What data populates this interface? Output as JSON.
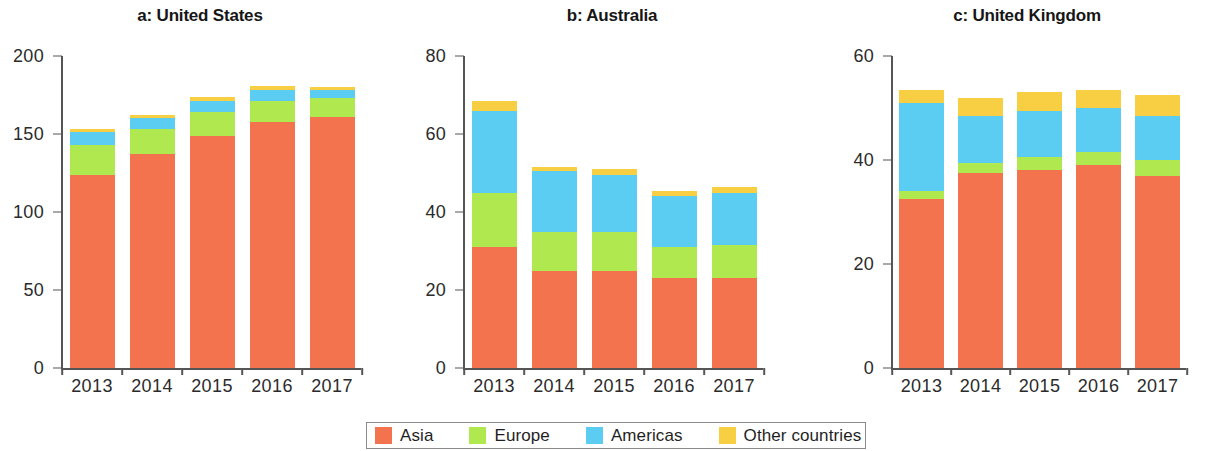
{
  "colors": {
    "asia": "#F4734F",
    "europe": "#B0E94F",
    "americas": "#5CCDF2",
    "other": "#F8CE43",
    "axis": "#555555",
    "text": "#1a1a1a",
    "background": "#ffffff"
  },
  "legend": {
    "items": [
      {
        "label": "Asia",
        "color": "#F4734F"
      },
      {
        "label": "Europe",
        "color": "#B0E94F"
      },
      {
        "label": "Americas",
        "color": "#5CCDF2"
      },
      {
        "label": "Other countries",
        "color": "#F8CE43"
      }
    ]
  },
  "chart_data": [
    {
      "type": "bar",
      "stacked": true,
      "panel": "a",
      "title": "a: United States",
      "xlabel": "",
      "ylabel": "",
      "categories": [
        "2013",
        "2014",
        "2015",
        "2016",
        "2017"
      ],
      "ylim": [
        0,
        200
      ],
      "yticks": [
        0,
        50,
        100,
        150,
        200
      ],
      "grid": false,
      "legend_position": "bottom",
      "series": [
        {
          "name": "Asia",
          "color": "#F4734F",
          "values": [
            124,
            137,
            149,
            158,
            161
          ]
        },
        {
          "name": "Europe",
          "color": "#B0E94F",
          "values": [
            19,
            16,
            15,
            13,
            12
          ]
        },
        {
          "name": "Americas",
          "color": "#5CCDF2",
          "values": [
            8,
            7,
            7,
            7,
            5
          ]
        },
        {
          "name": "Other countries",
          "color": "#F8CE43",
          "values": [
            2,
            2,
            3,
            3,
            2
          ]
        }
      ],
      "totals": [
        153,
        162,
        174,
        181,
        180
      ]
    },
    {
      "type": "bar",
      "stacked": true,
      "panel": "b",
      "title": "b: Australia",
      "xlabel": "",
      "ylabel": "",
      "categories": [
        "2013",
        "2014",
        "2015",
        "2016",
        "2017"
      ],
      "ylim": [
        0,
        80
      ],
      "yticks": [
        0,
        20,
        40,
        60,
        80
      ],
      "grid": false,
      "legend_position": "bottom",
      "series": [
        {
          "name": "Asia",
          "color": "#F4734F",
          "values": [
            31,
            25,
            25,
            23,
            23
          ]
        },
        {
          "name": "Europe",
          "color": "#B0E94F",
          "values": [
            14,
            10,
            10,
            8,
            8.5
          ]
        },
        {
          "name": "Americas",
          "color": "#5CCDF2",
          "values": [
            21,
            15.5,
            14.5,
            13,
            13.5
          ]
        },
        {
          "name": "Other countries",
          "color": "#F8CE43",
          "values": [
            2.5,
            1,
            1.5,
            1.5,
            1.5
          ]
        }
      ],
      "totals": [
        68.5,
        51.5,
        51,
        45.5,
        46.5
      ]
    },
    {
      "type": "bar",
      "stacked": true,
      "panel": "c",
      "title": "c: United Kingdom",
      "xlabel": "",
      "ylabel": "",
      "categories": [
        "2013",
        "2014",
        "2015",
        "2016",
        "2017"
      ],
      "ylim": [
        0,
        60
      ],
      "yticks": [
        0,
        20,
        40,
        60
      ],
      "grid": false,
      "legend_position": "bottom",
      "series": [
        {
          "name": "Asia",
          "color": "#F4734F",
          "values": [
            32.5,
            37.5,
            38,
            39,
            37
          ]
        },
        {
          "name": "Europe",
          "color": "#B0E94F",
          "values": [
            1.5,
            2,
            2.5,
            2.5,
            3
          ]
        },
        {
          "name": "Americas",
          "color": "#5CCDF2",
          "values": [
            17,
            9,
            9,
            8.5,
            8.5
          ]
        },
        {
          "name": "Other countries",
          "color": "#F8CE43",
          "values": [
            2.5,
            3.5,
            3.5,
            3.5,
            4
          ]
        }
      ],
      "totals": [
        53.5,
        52,
        53,
        53.5,
        52.5
      ]
    }
  ]
}
